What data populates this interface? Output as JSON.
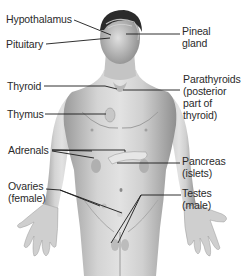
{
  "diagram": {
    "colors": {
      "text": "#2a2a2a",
      "line": "#1a1a1a",
      "skin": "#c9c9c9",
      "hair": "#2b2b2b",
      "organ": "#e8e8e8"
    },
    "labels_left": [
      {
        "id": "hypothalamus",
        "text": "Hypothalamus"
      },
      {
        "id": "pituitary",
        "text": "Pituitary"
      },
      {
        "id": "thyroid",
        "text": "Thyroid"
      },
      {
        "id": "thymus",
        "text": "Thymus"
      },
      {
        "id": "adrenals",
        "text": "Adrenals"
      },
      {
        "id": "ovaries",
        "text": "Ovaries\n(female)"
      }
    ],
    "labels_right": [
      {
        "id": "pineal",
        "text": "Pineal\ngland"
      },
      {
        "id": "parathyroids",
        "text": "Parathyroids\n(posterior\npart of\nthyroid)"
      },
      {
        "id": "pancreas",
        "text": "Pancreas\n(islets)"
      },
      {
        "id": "testes",
        "text": "Testes\n(male)"
      }
    ]
  }
}
